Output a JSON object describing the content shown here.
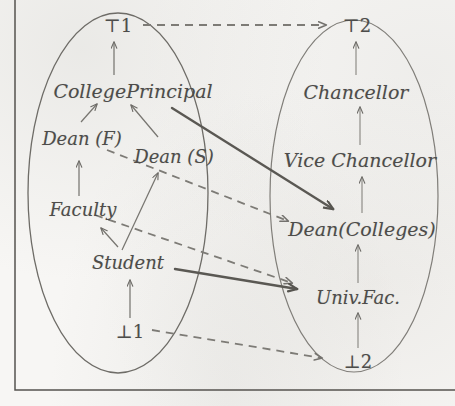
{
  "figure": {
    "frame_color": "#55534f",
    "ink_color": "#4d4c4a",
    "paper_color": "#f7f6f4"
  },
  "left_lattice": {
    "name": "College lattice",
    "nodes": {
      "top": "⊤1",
      "principal": "CollegePrincipal",
      "dean_f": "Dean (F)",
      "dean_s": "Dean (S)",
      "faculty": "Faculty",
      "student": "Student",
      "bottom": "⊥1"
    }
  },
  "right_lattice": {
    "name": "University lattice",
    "nodes": {
      "top": "⊤2",
      "chancellor": "Chancellor",
      "vice_chancellor": "Vice Chancellor",
      "dean_colleges": "Dean(Colleges)",
      "univ_fac": "Univ.Fac.",
      "bottom": "⊥2"
    }
  },
  "edges": {
    "left_internal": [
      {
        "from": "CollegePrincipal",
        "to": "⊤1",
        "style": "solid-thin"
      },
      {
        "from": "Dean (F)",
        "to": "CollegePrincipal",
        "style": "solid-thin"
      },
      {
        "from": "Dean (S)",
        "to": "CollegePrincipal",
        "style": "solid-thin"
      },
      {
        "from": "Faculty",
        "to": "Dean (F)",
        "style": "solid-thin"
      },
      {
        "from": "Student",
        "to": "Dean (S)",
        "style": "solid-thin"
      },
      {
        "from": "Student",
        "to": "Faculty",
        "style": "solid-thin"
      },
      {
        "from": "⊥1",
        "to": "Student",
        "style": "solid-thin"
      }
    ],
    "right_internal": [
      {
        "from": "Chancellor",
        "to": "⊤2",
        "style": "solid-thin"
      },
      {
        "from": "Vice Chancellor",
        "to": "Chancellor",
        "style": "solid-thin"
      },
      {
        "from": "Dean(Colleges)",
        "to": "Vice Chancellor",
        "style": "solid-thin"
      },
      {
        "from": "Univ.Fac.",
        "to": "Dean(Colleges)",
        "style": "solid-thin"
      },
      {
        "from": "⊥2",
        "to": "Univ.Fac.",
        "style": "solid-thin"
      }
    ],
    "cross_dashed": [
      {
        "from": "⊤1",
        "to": "⊤2",
        "style": "dashed"
      },
      {
        "from": "Dean (F)",
        "to": "Dean(Colleges)",
        "style": "dashed"
      },
      {
        "from": "Dean (F)",
        "to": "Univ.Fac.",
        "style": "dashed"
      },
      {
        "from": "⊥1",
        "to": "⊥2",
        "style": "dashed"
      }
    ],
    "cross_solid_bold": [
      {
        "from": "CollegePrincipal",
        "to": "Dean(Colleges)",
        "style": "solid-bold"
      },
      {
        "from": "Student",
        "to": "Univ.Fac.",
        "style": "solid-bold"
      }
    ]
  }
}
